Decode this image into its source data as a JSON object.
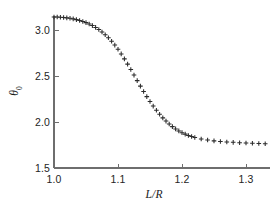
{
  "chart_data": {
    "type": "scatter",
    "title": "",
    "subtitle": "",
    "xlabel": "L/R",
    "ylabel": "θ",
    "ylabel_sub": "0",
    "xlim": [
      0.985,
      1.335
    ],
    "ylim": [
      1.5,
      3.25
    ],
    "xticks": [
      1.0,
      1.1,
      1.2,
      1.3
    ],
    "xtick_labels": [
      "1.0",
      "1.1",
      "1.2",
      "1.3"
    ],
    "yticks": [
      1.5,
      2.0,
      2.5,
      3.0
    ],
    "ytick_labels": [
      "1.5",
      "2.0",
      "2.5",
      "3.0"
    ],
    "grid": false,
    "legend": null,
    "marker": "plus",
    "marker_color": "#2b2b2b",
    "axis_color": "#6e6e6e",
    "series": [
      {
        "name": "theta0 vs L/R",
        "x": [
          1.0,
          1.005,
          1.01,
          1.015,
          1.02,
          1.025,
          1.03,
          1.035,
          1.04,
          1.045,
          1.05,
          1.055,
          1.06,
          1.065,
          1.07,
          1.075,
          1.08,
          1.085,
          1.09,
          1.095,
          1.1,
          1.105,
          1.11,
          1.115,
          1.12,
          1.125,
          1.13,
          1.135,
          1.14,
          1.145,
          1.15,
          1.155,
          1.16,
          1.165,
          1.17,
          1.175,
          1.18,
          1.185,
          1.19,
          1.195,
          1.2,
          1.205,
          1.21,
          1.215,
          1.22,
          1.23,
          1.24,
          1.25,
          1.26,
          1.27,
          1.28,
          1.29,
          1.3,
          1.31,
          1.32,
          1.33
        ],
        "y": [
          3.142,
          3.141,
          3.139,
          3.136,
          3.132,
          3.127,
          3.121,
          3.113,
          3.104,
          3.093,
          3.08,
          3.065,
          3.048,
          3.028,
          3.005,
          2.979,
          2.949,
          2.916,
          2.878,
          2.836,
          2.79,
          2.74,
          2.686,
          2.629,
          2.57,
          2.51,
          2.45,
          2.39,
          2.332,
          2.276,
          2.223,
          2.173,
          2.127,
          2.084,
          2.045,
          2.01,
          1.978,
          1.95,
          1.925,
          1.903,
          1.884,
          1.868,
          1.854,
          1.842,
          1.832,
          1.816,
          1.804,
          1.795,
          1.788,
          1.783,
          1.779,
          1.775,
          1.772,
          1.769,
          1.766,
          1.764
        ]
      }
    ]
  },
  "axis": {
    "x_title": "L/R",
    "y_title": "θ",
    "y_title_sub": "0"
  }
}
